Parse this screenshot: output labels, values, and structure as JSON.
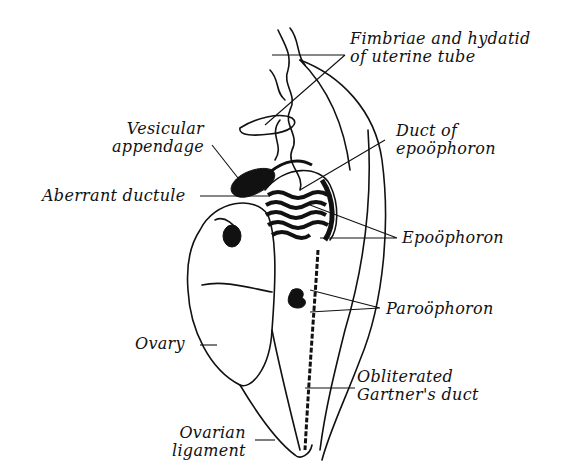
{
  "figure": {
    "colors": {
      "ink": "#111111",
      "background": "#ffffff"
    }
  },
  "labels": {
    "fimbriae": {
      "line1": "Fimbriae and hydatid",
      "line2": "of uterine tube"
    },
    "vesicular": {
      "line1": "Vesicular",
      "line2": "appendage"
    },
    "duct_epo": {
      "line1": "Duct of",
      "line2": "epoöphoron"
    },
    "aberrant": {
      "line1": "Aberrant ductule"
    },
    "epoophoron": {
      "line1": "Epoöphoron"
    },
    "paroophoron": {
      "line1": "Paroöphoron"
    },
    "ovary": {
      "line1": "Ovary"
    },
    "gartner": {
      "line1": "Obliterated",
      "line2": "Gartner's duct"
    },
    "ovarian_lig": {
      "line1": "Ovarian",
      "line2": "ligament"
    }
  }
}
